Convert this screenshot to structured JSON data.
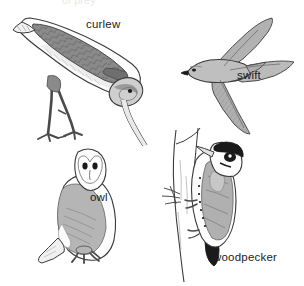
{
  "plate": {
    "title": "Bird identification plate",
    "background_color": "#ffffff",
    "width": 304,
    "height": 286,
    "partial_top_text": "of prey"
  },
  "palette": {
    "outline": "#3b3b3b",
    "ink": "#1c1c1c",
    "dark_fill": "#6f6f6f",
    "mid_fill": "#9a9a9a",
    "light_fill": "#c3c3c3",
    "pale_fill": "#e4e4e4",
    "white_fill": "#fdfdfd",
    "black_fill": "#1a1a1a",
    "hatch": "#8a8a8a",
    "background": "#ffffff"
  },
  "birds": [
    {
      "id": "curlew",
      "label": "curlew",
      "position": "top-left",
      "pose": "bent forward probing with long downcurved bill",
      "label_x": 86,
      "label_y": 19
    },
    {
      "id": "swift",
      "label": "swift",
      "position": "top-right",
      "pose": "in flight with swept scythe-shaped wings",
      "label_x": 237,
      "label_y": 70
    },
    {
      "id": "owl",
      "label": "owl",
      "position": "bottom-left",
      "pose": "perched barn owl, heart-shaped facial disc",
      "label_x": 90,
      "label_y": 192
    },
    {
      "id": "woodpecker",
      "label": "woodpecker",
      "position": "bottom-right",
      "pose": "clinging vertically to a tree trunk",
      "label_x": 213,
      "label_y": 252
    }
  ]
}
